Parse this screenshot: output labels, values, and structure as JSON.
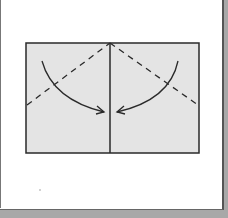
{
  "diagram": {
    "colors": {
      "paper_fill": "#e4e4e4",
      "outline": "#2a2a2a",
      "page": "#ffffff",
      "background": "#a8a8a8"
    },
    "elements": {
      "sheet": "rectangle",
      "center_line": "solid crease",
      "valley_folds": [
        "left diagonal dashed line",
        "right diagonal dashed line"
      ],
      "arrows": [
        "left arrow curving to center",
        "right arrow curving to center"
      ]
    }
  }
}
